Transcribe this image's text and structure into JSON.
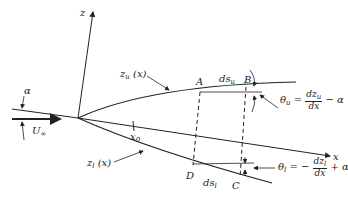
{
  "diagram": {
    "labels": {
      "z_axis": "z",
      "x_axis": "x",
      "alpha": "α",
      "freestream": "U",
      "freestream_sub": "∞",
      "upper_surface": "z",
      "upper_surface_sub": "u",
      "upper_surface_arg": "(x)",
      "lower_surface": "z",
      "lower_surface_sub": "l",
      "lower_surface_arg": "(x)",
      "x0": "x",
      "x0_sub": "0",
      "point_A": "A",
      "point_B": "B",
      "point_C": "C",
      "point_D": "D",
      "ds_upper": "ds",
      "ds_upper_sub": "u",
      "ds_lower": "ds",
      "ds_lower_sub": "l"
    },
    "equations": {
      "theta_u": {
        "lhs": "θ",
        "lhs_sub": "u",
        "eq": "=",
        "num": "dz",
        "num_sub": "u",
        "den": "dx",
        "tail": "− α"
      },
      "theta_l": {
        "lhs": "θ",
        "lhs_sub": "l",
        "eq": "= −",
        "num": "dz",
        "num_sub": "l",
        "den": "dx",
        "tail": "+ α"
      }
    },
    "colors": {
      "ink": "#222222",
      "background": "#ffffff"
    }
  }
}
